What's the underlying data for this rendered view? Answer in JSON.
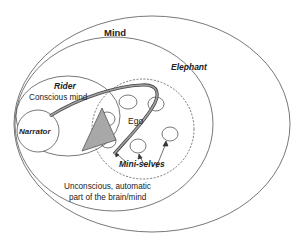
{
  "diagram": {
    "labels": {
      "mind": "Mind",
      "elephant": "Elephant",
      "rider": "Rider",
      "conscious_mind": "Conscious mind",
      "narrator": "Narrator",
      "ego": "Ego",
      "mini_selves": "Mini-selves",
      "unconscious_line1": "Unconscious, automatic",
      "unconscious_line2": "part of the brain/mind"
    },
    "colors": {
      "stroke": "#444444",
      "arrow_fill": "#9a9a9a",
      "triangle_fill": "#a8a8a8"
    }
  }
}
